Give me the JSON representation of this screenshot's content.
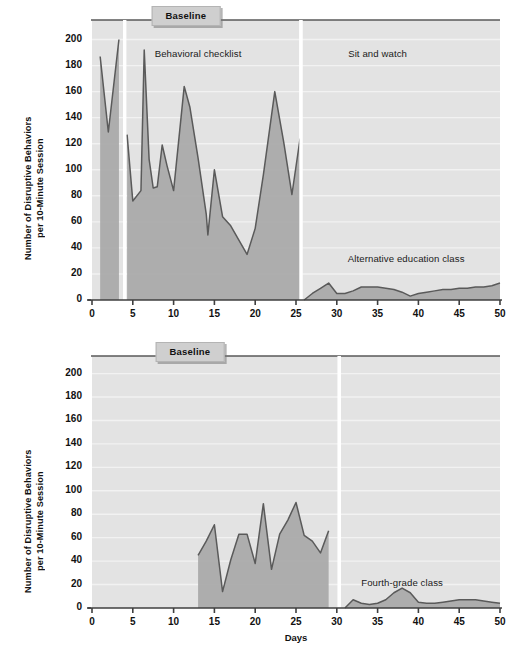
{
  "figure": {
    "background_color": "#ffffff",
    "plot_background_color": "#e3e3e3",
    "series_fill_color": "#a8a8a8",
    "series_line_color": "#5a5a5a",
    "gridline_color": "#f2f2f2",
    "axis_color": "#4a4a4a",
    "badge_color": "#cfcfcf"
  },
  "axes": {
    "y_title": "Number of Disruptive Behaviors\nper 10-Minute Session",
    "x_title": "Days",
    "y_ticks": [
      0,
      20,
      40,
      60,
      80,
      100,
      120,
      140,
      160,
      180,
      200
    ],
    "x_ticks": [
      0,
      5,
      10,
      15,
      20,
      25,
      30,
      35,
      40,
      45,
      50
    ],
    "ylim": [
      0,
      210
    ],
    "xlim": [
      0,
      50
    ]
  },
  "chart_data": [
    {
      "id": "top-panel",
      "type": "area",
      "title": "",
      "subtitle": "",
      "xlabel": "",
      "ylabel": "Number of Disruptive Behaviors per 10-Minute Session",
      "xlim": [
        0,
        50
      ],
      "ylim": [
        0,
        210
      ],
      "grid": true,
      "legend_position": "none",
      "annotations": [
        {
          "text": "Baseline",
          "style": "badge",
          "x": 11.5,
          "y": 218
        },
        {
          "text": "Behavioral checklist",
          "style": "plain",
          "x": 13.0,
          "y": 190
        },
        {
          "text": "Sit and watch",
          "style": "plain",
          "x": 35.0,
          "y": 190
        },
        {
          "text": "Alternative education class",
          "style": "plain",
          "x": 38.5,
          "y": 32
        }
      ],
      "phase_change_lines": [
        4.0,
        25.6
      ],
      "series": [
        {
          "name": "Baseline",
          "x": [
            1,
            2,
            3.3
          ],
          "values": [
            187,
            129,
            200
          ]
        },
        {
          "name": "Behavioral checklist",
          "x": [
            4.3,
            5,
            6,
            6.4,
            7,
            7.5,
            8,
            8.6,
            9.2,
            10,
            11.3,
            12,
            13,
            14,
            14.2,
            15,
            16,
            17,
            18,
            19,
            20,
            21,
            22.4,
            23.5,
            24.5,
            25.5
          ],
          "values": [
            127,
            76,
            84,
            192,
            108,
            86,
            87,
            119,
            103,
            84,
            164,
            148,
            109,
            66,
            50,
            100,
            64,
            57,
            46,
            35,
            55,
            96,
            160,
            121,
            81,
            124
          ]
        },
        {
          "name": "Alternative education class",
          "x": [
            26,
            27,
            28,
            29,
            30,
            31,
            32,
            33,
            34,
            35,
            36,
            37,
            38,
            39,
            40,
            41,
            42,
            43,
            44,
            45,
            46,
            47,
            48,
            49,
            50
          ],
          "values": [
            0,
            5,
            9,
            13,
            5,
            5,
            7,
            10,
            10,
            10,
            9,
            8,
            6,
            3,
            5,
            6,
            7,
            8,
            8,
            9,
            9,
            10,
            10,
            11,
            13
          ]
        }
      ]
    },
    {
      "id": "bottom-panel",
      "type": "area",
      "title": "",
      "subtitle": "",
      "xlabel": "Days",
      "ylabel": "Number of Disruptive Behaviors per 10-Minute Session",
      "xlim": [
        0,
        50
      ],
      "ylim": [
        0,
        210
      ],
      "grid": true,
      "legend_position": "none",
      "annotations": [
        {
          "text": "Baseline",
          "style": "badge",
          "x": 12.0,
          "y": 218
        },
        {
          "text": "Fourth-grade class",
          "style": "plain",
          "x": 38.0,
          "y": 22
        }
      ],
      "phase_change_lines": [
        30.3
      ],
      "series": [
        {
          "name": "Baseline",
          "x": [
            13,
            14,
            15,
            16,
            17,
            18,
            19,
            20,
            21,
            22,
            23,
            24,
            25,
            26,
            27,
            28,
            29
          ],
          "values": [
            45,
            57,
            71,
            14,
            41,
            63,
            63,
            38,
            89,
            33,
            63,
            75,
            90,
            62,
            57,
            47,
            66
          ]
        },
        {
          "name": "Fourth-grade class",
          "x": [
            31,
            32,
            33,
            34,
            35,
            36,
            37,
            38,
            39,
            40,
            41,
            42,
            43,
            44,
            45,
            46,
            47,
            48,
            49,
            50
          ],
          "values": [
            0,
            7,
            4,
            3,
            4,
            7,
            13,
            17,
            13,
            5,
            4,
            4,
            5,
            6,
            7,
            7,
            7,
            6,
            5,
            4
          ]
        }
      ]
    }
  ]
}
